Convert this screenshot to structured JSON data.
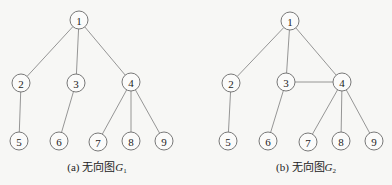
{
  "graphs": [
    {
      "id": "G1",
      "caption": {
        "prefix": "(a) 无向图",
        "var": "G",
        "sub": "1"
      },
      "caption_x": 97,
      "nodes": [
        {
          "id": "1",
          "x": 79,
          "y": 20
        },
        {
          "id": "2",
          "x": 21,
          "y": 83
        },
        {
          "id": "3",
          "x": 76,
          "y": 83
        },
        {
          "id": "4",
          "x": 131,
          "y": 82
        },
        {
          "id": "5",
          "x": 19,
          "y": 141
        },
        {
          "id": "6",
          "x": 59,
          "y": 141
        },
        {
          "id": "7",
          "x": 98,
          "y": 142
        },
        {
          "id": "8",
          "x": 131,
          "y": 141
        },
        {
          "id": "9",
          "x": 164,
          "y": 141
        }
      ],
      "edges": [
        [
          "1",
          "2"
        ],
        [
          "1",
          "3"
        ],
        [
          "1",
          "4"
        ],
        [
          "2",
          "5"
        ],
        [
          "3",
          "6"
        ],
        [
          "4",
          "7"
        ],
        [
          "4",
          "8"
        ],
        [
          "4",
          "9"
        ]
      ]
    },
    {
      "id": "G2",
      "caption": {
        "prefix": "(b) 无向图",
        "var": "G",
        "sub": "2"
      },
      "caption_x": 306,
      "nodes": [
        {
          "id": "1",
          "x": 290,
          "y": 21
        },
        {
          "id": "2",
          "x": 231,
          "y": 83
        },
        {
          "id": "3",
          "x": 286,
          "y": 82
        },
        {
          "id": "4",
          "x": 342,
          "y": 82
        },
        {
          "id": "5",
          "x": 228,
          "y": 141
        },
        {
          "id": "6",
          "x": 268,
          "y": 141
        },
        {
          "id": "7",
          "x": 308,
          "y": 142
        },
        {
          "id": "8",
          "x": 341,
          "y": 141
        },
        {
          "id": "9",
          "x": 374,
          "y": 141
        }
      ],
      "edges": [
        [
          "1",
          "2"
        ],
        [
          "1",
          "3"
        ],
        [
          "1",
          "4"
        ],
        [
          "3",
          "4"
        ],
        [
          "2",
          "5"
        ],
        [
          "3",
          "6"
        ],
        [
          "4",
          "7"
        ],
        [
          "4",
          "8"
        ],
        [
          "4",
          "9"
        ]
      ]
    }
  ],
  "style": {
    "node_radius": 9,
    "edge_color": "#8a8a8a",
    "node_stroke": "#6a6a6a"
  }
}
